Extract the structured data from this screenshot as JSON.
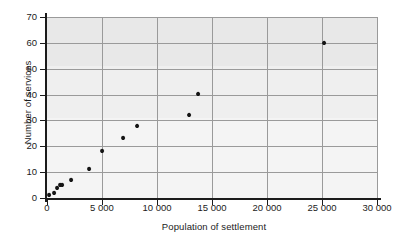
{
  "chart_data": {
    "type": "scatter",
    "title": "",
    "xlabel": "Population of settlement",
    "ylabel": "Number of services",
    "xlim": [
      0,
      30000
    ],
    "ylim": [
      0,
      70
    ],
    "grid": true,
    "legend": null,
    "xticks": [
      0,
      5000,
      10000,
      15000,
      20000,
      25000,
      30000
    ],
    "xtick_labels": [
      "0",
      "5 000",
      "10 000",
      "15 000",
      "20 000",
      "25 000",
      "30 000"
    ],
    "yticks": [
      0,
      10,
      20,
      30,
      40,
      50,
      60,
      70
    ],
    "ytick_labels": [
      "0",
      "10",
      "20",
      "30",
      "40",
      "50",
      "60",
      "70"
    ],
    "series": [
      {
        "name": "settlements",
        "marker": "diamond",
        "color": "#141414",
        "points": [
          {
            "x": 200,
            "y": 1
          },
          {
            "x": 600,
            "y": 2
          },
          {
            "x": 900,
            "y": 4
          },
          {
            "x": 1150,
            "y": 5
          },
          {
            "x": 1400,
            "y": 5
          },
          {
            "x": 2200,
            "y": 7
          },
          {
            "x": 3800,
            "y": 11
          },
          {
            "x": 5000,
            "y": 18
          },
          {
            "x": 6900,
            "y": 23
          },
          {
            "x": 8200,
            "y": 28
          },
          {
            "x": 12900,
            "y": 32
          },
          {
            "x": 13700,
            "y": 40
          },
          {
            "x": 25200,
            "y": 60
          }
        ]
      }
    ],
    "colors": {
      "panel_background": "#f4f4f4",
      "panel_top_band": "#e8e8e8",
      "gridline": "#9a9a9a",
      "axis": "#1b1b1b",
      "marker": "#141414",
      "text": "#1b1b1b"
    }
  }
}
